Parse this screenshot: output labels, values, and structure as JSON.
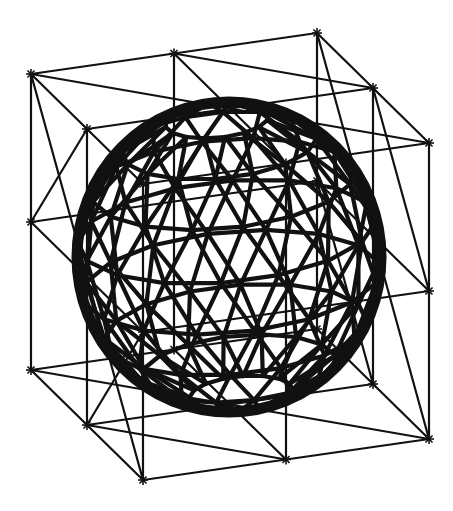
{
  "figure": {
    "width": 453,
    "height": 511,
    "background": "#ffffff",
    "stroke_color": "#111111"
  },
  "lattice": {
    "divisions": 2,
    "origin": [
      31,
      74
    ],
    "x_vector": [
      143,
      -20.5
    ],
    "depth_vector": [
      56,
      55
    ],
    "vertical_vector": [
      0,
      148
    ],
    "node_marker": "asterisk",
    "line_width": 2.2
  },
  "sphere": {
    "center": [
      229,
      257
    ],
    "radius_x": 152,
    "radius_y": 155,
    "rim_width": 11,
    "latitude_bands": 9,
    "longitude_segments": 16,
    "line_width": 4.2
  }
}
